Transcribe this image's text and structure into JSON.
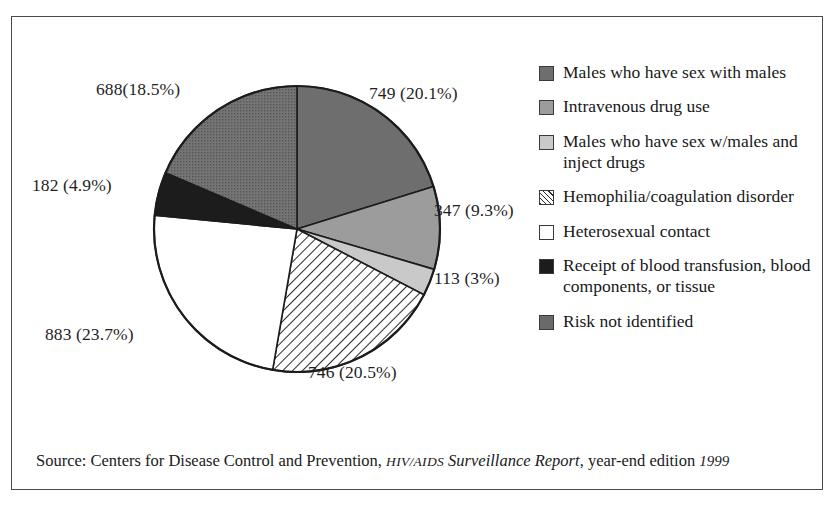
{
  "chart_data": {
    "type": "pie",
    "title": "",
    "subtitle": "",
    "legend_position": "right",
    "grid": false,
    "total": 3728,
    "units": "cases",
    "categories": [
      "Males who have sex with males",
      "Intravenous drug use",
      "Males who have sex w/males and inject drugs",
      "Hemophilia/coagulation disorder",
      "Heterosexual contact",
      "Receipt of blood transfusion, blood components, or tissue",
      "Risk not identified"
    ],
    "values": [
      749,
      347,
      113,
      746,
      883,
      182,
      688
    ],
    "percents": [
      20.1,
      9.3,
      3,
      20.5,
      23.7,
      4.9,
      18.5
    ],
    "slice_fills": [
      "#6e6e6e",
      "#9c9c9c",
      "#c9c9c9",
      "hatch",
      "#ffffff",
      "#1c1c1c",
      "#6a6a6a"
    ],
    "start_angle_deg": 0,
    "direction": "clockwise"
  },
  "slice_labels": {
    "msm": "749 (20.1%)",
    "idu": "347 (9.3%)",
    "msm_idu": "113 (3%)",
    "hemophilia": "746 (20.5%)",
    "heterosexual": "883 (23.7%)",
    "transfusion": "182 (4.9%)",
    "not_identified": "688(18.5%)"
  },
  "legend": {
    "items": [
      {
        "label": "Males who have sex with males",
        "swatch": "sw-darkgray",
        "swatch_name": "dark-gray-swatch"
      },
      {
        "label": "Intravenous drug use",
        "swatch": "sw-medgray",
        "swatch_name": "medium-gray-swatch"
      },
      {
        "label": "Males who have sex w/males and inject drugs",
        "swatch": "sw-lightgray",
        "swatch_name": "light-gray-swatch"
      },
      {
        "label": "Hemophilia/coagulation disorder",
        "swatch": "sw-hatch",
        "swatch_name": "diagonal-hatch-swatch"
      },
      {
        "label": "Heterosexual contact",
        "swatch": "sw-white",
        "swatch_name": "white-swatch"
      },
      {
        "label": "Receipt of blood transfusion, blood components, or tissue",
        "swatch": "sw-black",
        "swatch_name": "black-swatch"
      },
      {
        "label": "Risk not identified",
        "swatch": "sw-texture",
        "swatch_name": "textured-gray-swatch"
      }
    ]
  },
  "source": {
    "prefix": "Source: Centers for Disease Control and Prevention, ",
    "report_smallcaps": "HIV/AIDS",
    "report_title": " Surveillance Report",
    "suffix": ", year-end edition ",
    "year": "1999"
  },
  "colors": {
    "frame_border": "#4a4a4a",
    "text": "#1a1a1a",
    "slice_outline": "#1c1c1c",
    "background": "#ffffff"
  }
}
